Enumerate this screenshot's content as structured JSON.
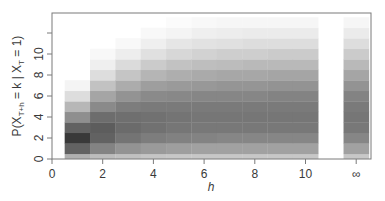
{
  "chart_data": {
    "type": "heatmap",
    "title": "",
    "xlabel": "h",
    "ylabel": "P(X_{T+h} = k | X_T = 1)",
    "ylabel_parts": {
      "main": "P(X",
      "sub1": "T+h",
      "mid": " = k | X",
      "sub2": "T",
      "end": " = 1)"
    },
    "x_ticks": [
      {
        "value": 0,
        "label": "0"
      },
      {
        "value": 2,
        "label": "2"
      },
      {
        "value": 4,
        "label": "4"
      },
      {
        "value": 6,
        "label": "6"
      },
      {
        "value": 8,
        "label": "8"
      },
      {
        "value": 10,
        "label": "10"
      },
      {
        "value": 12,
        "label": "∞"
      }
    ],
    "y_ticks": [
      {
        "value": 0,
        "label": "0"
      },
      {
        "value": 2,
        "label": "2"
      },
      {
        "value": 4,
        "label": "4"
      },
      {
        "value": 6,
        "label": "6"
      },
      {
        "value": 8,
        "label": "8"
      },
      {
        "value": 10,
        "label": "10"
      },
      {
        "value": 12,
        "label": ""
      }
    ],
    "xlim": [
      0,
      12.5
    ],
    "ylim": [
      0,
      13.9
    ],
    "grid": false,
    "legend": null,
    "colormap": "grayscale (white = 0, black = max)",
    "columns": [
      {
        "h": 1,
        "label": "1",
        "values": [
          0.35,
          0.7,
          0.88,
          0.7,
          0.5,
          0.32,
          0.15,
          0.05
        ]
      },
      {
        "h": 2,
        "label": "2",
        "values": [
          0.3,
          0.55,
          0.7,
          0.72,
          0.65,
          0.52,
          0.4,
          0.27,
          0.15,
          0.07,
          0.03
        ]
      },
      {
        "h": 3,
        "label": "3",
        "values": [
          0.28,
          0.48,
          0.62,
          0.66,
          0.64,
          0.58,
          0.48,
          0.37,
          0.26,
          0.16,
          0.08,
          0.03
        ]
      },
      {
        "h": 4,
        "label": "4",
        "values": [
          0.26,
          0.45,
          0.58,
          0.63,
          0.63,
          0.59,
          0.52,
          0.43,
          0.33,
          0.23,
          0.14,
          0.07,
          0.03
        ]
      },
      {
        "h": 5,
        "label": "5",
        "values": [
          0.25,
          0.43,
          0.56,
          0.61,
          0.62,
          0.59,
          0.53,
          0.45,
          0.36,
          0.27,
          0.18,
          0.11,
          0.05,
          0.02
        ]
      },
      {
        "h": 6,
        "label": "6",
        "values": [
          0.25,
          0.42,
          0.55,
          0.6,
          0.61,
          0.59,
          0.54,
          0.46,
          0.38,
          0.29,
          0.2,
          0.13,
          0.07,
          0.03
        ]
      },
      {
        "h": 7,
        "label": "7",
        "values": [
          0.25,
          0.42,
          0.54,
          0.6,
          0.61,
          0.59,
          0.54,
          0.47,
          0.39,
          0.3,
          0.22,
          0.14,
          0.08,
          0.04
        ]
      },
      {
        "h": 8,
        "label": "8",
        "values": [
          0.25,
          0.42,
          0.54,
          0.6,
          0.61,
          0.59,
          0.54,
          0.47,
          0.39,
          0.31,
          0.22,
          0.15,
          0.09,
          0.04
        ]
      },
      {
        "h": 9,
        "label": "9",
        "values": [
          0.25,
          0.42,
          0.54,
          0.6,
          0.61,
          0.59,
          0.55,
          0.48,
          0.4,
          0.31,
          0.23,
          0.15,
          0.09,
          0.04
        ]
      },
      {
        "h": 10,
        "label": "10",
        "values": [
          0.25,
          0.42,
          0.54,
          0.6,
          0.61,
          0.59,
          0.55,
          0.48,
          0.4,
          0.31,
          0.23,
          0.15,
          0.09,
          0.04
        ]
      },
      {
        "h": 12,
        "label": "∞",
        "values": [
          0.25,
          0.42,
          0.54,
          0.6,
          0.61,
          0.59,
          0.55,
          0.48,
          0.4,
          0.31,
          0.23,
          0.15,
          0.09,
          0.04
        ]
      }
    ]
  },
  "layout": {
    "plot_left": 52,
    "plot_right": 371,
    "plot_top": 13,
    "plot_bottom": 159,
    "x_scale": 25.35,
    "y_scale": 10.5
  }
}
